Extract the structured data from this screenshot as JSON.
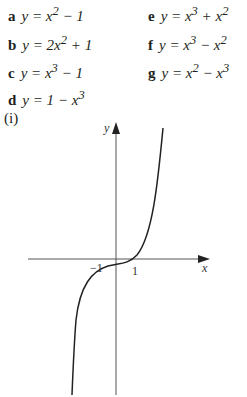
{
  "equations": [
    {
      "label": "a",
      "html": "y = x<sup>2</sup> − 1"
    },
    {
      "label": "b",
      "html": "y = 2x<sup>2</sup> + 1"
    },
    {
      "label": "c",
      "html": "y = x<sup>3</sup> − 1"
    },
    {
      "label": "d",
      "html": "y = 1 − x<sup>3</sup>"
    },
    {
      "label": "e",
      "html": "y = x<sup>3</sup> + x<sup>2</sup>"
    },
    {
      "label": "f",
      "html": "y = x<sup>3</sup> − x<sup>2</sup>"
    },
    {
      "label": "g",
      "html": "y = x<sup>2</sup> − x<sup>3</sup>"
    }
  ],
  "graph": {
    "label": "(i)",
    "x_axis_label": "x",
    "y_axis_label": "y",
    "tick_labels": [
      "−1",
      "1"
    ]
  }
}
